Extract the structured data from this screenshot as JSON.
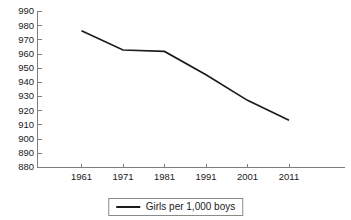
{
  "chart_data": {
    "type": "line",
    "title": "",
    "xlabel": "",
    "ylabel": "",
    "x": [
      1961,
      1971,
      1981,
      1991,
      2001,
      2011
    ],
    "categories": [
      "1961",
      "1971",
      "1981",
      "1991",
      "2001",
      "2011"
    ],
    "series": [
      {
        "name": "Girls per 1,000 boys",
        "values": [
          976,
          962.5,
          961.5,
          945,
          927,
          913
        ],
        "color": "#1c1c1c"
      }
    ],
    "ylim": [
      880,
      990
    ],
    "ytick_step": 10,
    "yticks": [
      880,
      890,
      900,
      910,
      920,
      930,
      940,
      950,
      960,
      970,
      980,
      990
    ],
    "ytick_labels": [
      "880",
      "890",
      "900",
      "910",
      "920",
      "930",
      "940",
      "950",
      "960",
      "970",
      "980",
      "990"
    ],
    "xticks": [
      1961,
      1971,
      1981,
      1991,
      2001,
      2011
    ],
    "xtick_labels": [
      "1961",
      "1971",
      "1981",
      "1991",
      "2001",
      "2011"
    ],
    "grid": false,
    "legend": {
      "position": "bottom-center",
      "boxed": true,
      "entries": [
        {
          "label": "Girls per 1,000 boys",
          "marker": "line",
          "color": "#1c1c1c"
        }
      ]
    },
    "axis_color": "#7d7d7d",
    "background": "#ffffff"
  },
  "legend": {
    "label": "Girls per 1,000 boys"
  },
  "header": {
    "clipped_title": ""
  }
}
